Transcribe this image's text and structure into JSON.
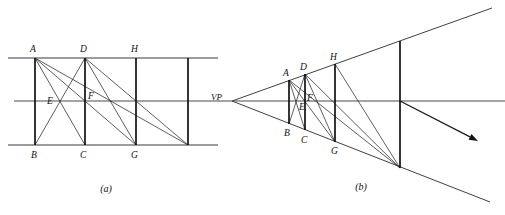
{
  "figure": {
    "background_color": "#ffffff",
    "line_color": "#2a2a2a",
    "post_color": "#111111",
    "width": 505,
    "height": 215
  },
  "panel_a": {
    "caption": "(a)",
    "caption_x": 106,
    "caption_y": 192,
    "description": "Orthographic (elevation) construction: equal bays divided by diagonals",
    "top_rail": {
      "x1": 8,
      "y1": 58,
      "x2": 218,
      "y2": 58
    },
    "bottom_rail": {
      "x1": 8,
      "y1": 145,
      "x2": 218,
      "y2": 145
    },
    "horizon": {
      "x1": 14,
      "y1": 101,
      "x2": 232,
      "y2": 101
    },
    "posts": [
      {
        "name": "post-AB",
        "x": 35,
        "y_top": 58,
        "y_bottom": 145
      },
      {
        "name": "post-DC",
        "x": 85,
        "y_top": 58,
        "y_bottom": 145
      },
      {
        "name": "post-HG",
        "x": 136,
        "y_top": 58,
        "y_bottom": 145
      },
      {
        "name": "post-4",
        "x": 188,
        "y_top": 58,
        "y_bottom": 145
      }
    ],
    "diagonals": [
      {
        "name": "diag-A-C",
        "x1": 35,
        "y1": 58,
        "x2": 85,
        "y2": 145
      },
      {
        "name": "diag-B-D",
        "x1": 35,
        "y1": 145,
        "x2": 85,
        "y2": 58
      },
      {
        "name": "diag-A-G",
        "x1": 35,
        "y1": 58,
        "x2": 136,
        "y2": 145
      },
      {
        "name": "diag-D-G",
        "x1": 85,
        "y1": 58,
        "x2": 136,
        "y2": 145
      },
      {
        "name": "diag-A-F-H",
        "x1": 35,
        "y1": 58,
        "x2": 188,
        "y2": 145
      },
      {
        "name": "diag-D-bottom4",
        "x1": 85,
        "y1": 58,
        "x2": 188,
        "y2": 145
      }
    ],
    "labels": [
      {
        "name": "label-A",
        "text": "A",
        "x": 30,
        "y": 52
      },
      {
        "name": "label-D",
        "text": "D",
        "x": 80,
        "y": 52
      },
      {
        "name": "label-H",
        "text": "H",
        "x": 131,
        "y": 52
      },
      {
        "name": "label-E",
        "text": "E",
        "x": 47,
        "y": 104
      },
      {
        "name": "label-F",
        "text": "F",
        "x": 88,
        "y": 99
      },
      {
        "name": "label-B",
        "text": "B",
        "x": 31,
        "y": 158
      },
      {
        "name": "label-C",
        "text": "C",
        "x": 80,
        "y": 158
      },
      {
        "name": "label-G",
        "text": "G",
        "x": 131,
        "y": 158
      }
    ]
  },
  "panel_b": {
    "caption": "(b)",
    "caption_x": 361,
    "caption_y": 190,
    "description": "Perspective construction: the same bays converging to the vanishing point VP",
    "vanishing_point": {
      "name": "VP",
      "x": 232,
      "y": 101
    },
    "vp_label": {
      "text": "VP",
      "x": 211,
      "y": 100
    },
    "top_receding": {
      "x1": 232,
      "y1": 101,
      "x2": 492,
      "y2": 8
    },
    "bottom_receding": {
      "x1": 232,
      "y1": 101,
      "x2": 490,
      "y2": 202
    },
    "horizon": {
      "x1": 232,
      "y1": 101,
      "x2": 505,
      "y2": 101
    },
    "posts": [
      {
        "name": "post-AB",
        "x": 289,
        "y_top": 80,
        "y_bottom": 124
      },
      {
        "name": "post-DC",
        "x": 305,
        "y_top": 74,
        "y_bottom": 130
      },
      {
        "name": "post-HG",
        "x": 335,
        "y_top": 64,
        "y_bottom": 142
      },
      {
        "name": "post-4",
        "x": 400,
        "y_top": 41,
        "y_bottom": 168
      }
    ],
    "diagonals": [
      {
        "name": "diag-A-C",
        "x1": 289,
        "y1": 80,
        "x2": 305,
        "y2": 130
      },
      {
        "name": "diag-B-D",
        "x1": 289,
        "y1": 124,
        "x2": 305,
        "y2": 74
      },
      {
        "name": "diag-A-G",
        "x1": 289,
        "y1": 80,
        "x2": 335,
        "y2": 142
      },
      {
        "name": "diag-D-G",
        "x1": 305,
        "y1": 74,
        "x2": 335,
        "y2": 142
      },
      {
        "name": "diag-A-bottom4",
        "x1": 289,
        "y1": 80,
        "x2": 400,
        "y2": 168
      },
      {
        "name": "diag-D-bottom4",
        "x1": 305,
        "y1": 74,
        "x2": 400,
        "y2": 168
      },
      {
        "name": "diag-H-bottom4",
        "x1": 335,
        "y1": 64,
        "x2": 400,
        "y2": 168
      }
    ],
    "labels": [
      {
        "name": "label-A",
        "text": "A",
        "x": 283,
        "y": 76
      },
      {
        "name": "label-D",
        "text": "D",
        "x": 300,
        "y": 70
      },
      {
        "name": "label-H",
        "text": "H",
        "x": 330,
        "y": 60
      },
      {
        "name": "label-E",
        "text": "E",
        "x": 299,
        "y": 110
      },
      {
        "name": "label-F",
        "text": "F",
        "x": 307,
        "y": 101
      },
      {
        "name": "label-B",
        "text": "B",
        "x": 284,
        "y": 136
      },
      {
        "name": "label-C",
        "text": "C",
        "x": 301,
        "y": 143
      },
      {
        "name": "label-G",
        "text": "G",
        "x": 331,
        "y": 154
      }
    ],
    "arrow": {
      "name": "direction-arrow",
      "x1": 400,
      "y1": 101,
      "x2": 478,
      "y2": 141
    }
  }
}
